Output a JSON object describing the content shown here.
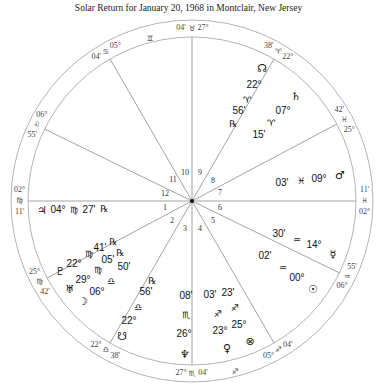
{
  "title": "Solar Return for January 20, 1968 in Montclair, New Jersey",
  "chart": {
    "center": [
      192,
      201
    ],
    "outer_radius": 181,
    "inner_radius": 164,
    "cusps": [
      {
        "house": 1,
        "angle": 180,
        "deg": "02°",
        "sign": "♍",
        "min": "11'",
        "lx": 14,
        "ly": 201
      },
      {
        "house": 2,
        "angle": 208,
        "deg": "25°",
        "sign": "♍",
        "min": "42'",
        "lx": 44,
        "ly": 272
      },
      {
        "house": 3,
        "angle": 240,
        "deg": "22°",
        "sign": "♎",
        "min": "38'",
        "lx": 100,
        "ly": 338
      },
      {
        "house": 4,
        "angle": 270,
        "deg": "27°",
        "sign": "♏",
        "min": "04'",
        "lx": 192,
        "ly": 374
      },
      {
        "house": 5,
        "angle": 300,
        "deg": "05°",
        "sign": "♐",
        "min": "04'",
        "lx": 276,
        "ly": 344
      },
      {
        "house": 6,
        "angle": 334,
        "deg": "06°",
        "sign": "♒",
        "min": "55'",
        "lx": 336,
        "ly": 293
      },
      {
        "house": 7,
        "angle": 0,
        "deg": "02°",
        "sign": "♓",
        "min": "11'",
        "lx": 364,
        "ly": 201
      },
      {
        "house": 8,
        "angle": 28,
        "deg": "25°",
        "sign": "♓",
        "min": "42'",
        "lx": 336,
        "ly": 122
      },
      {
        "house": 9,
        "angle": 60,
        "deg": "22°",
        "sign": "♈",
        "min": "38'",
        "lx": 286,
        "ly": 56
      },
      {
        "house": 10,
        "angle": 90,
        "deg": "27°",
        "sign": "♉",
        "min": "04'",
        "lx": 192,
        "ly": 28
      },
      {
        "house": 11,
        "angle": 120,
        "deg": "05°",
        "sign": "♋",
        "min": "04'",
        "lx": 107,
        "ly": 54
      },
      {
        "house": 12,
        "angle": 154,
        "deg": "06°",
        "sign": "♌",
        "min": "55'",
        "lx": 44,
        "ly": 112
      }
    ],
    "intercepted": [
      {
        "sign": "♊",
        "x": 150,
        "y": 39
      },
      {
        "sign": "♐",
        "x": 235,
        "y": 372
      }
    ],
    "house_numbers": [
      {
        "n": "1",
        "x": 165,
        "y": 208
      },
      {
        "n": "2",
        "x": 172,
        "y": 221
      },
      {
        "n": "3",
        "x": 185,
        "y": 229
      },
      {
        "n": "4",
        "x": 200,
        "y": 229
      },
      {
        "n": "5",
        "x": 213,
        "y": 221
      },
      {
        "n": "6",
        "x": 220,
        "y": 208
      },
      {
        "n": "7",
        "x": 220,
        "y": 193
      },
      {
        "n": "8",
        "x": 213,
        "y": 181
      },
      {
        "n": "9",
        "x": 200,
        "y": 173
      },
      {
        "n": "10",
        "x": 185,
        "y": 173
      },
      {
        "n": "11",
        "x": 173,
        "y": 180
      },
      {
        "n": "12",
        "x": 165,
        "y": 194
      }
    ],
    "planets": [
      {
        "name": "north-node",
        "glyph": "☊",
        "sign": "♈",
        "deg": "22°",
        "min": "56'",
        "retro": "℞",
        "items": [
          [
            "glyph",
            "☊",
            262,
            69
          ],
          [
            "text",
            "22°",
            254,
            85
          ],
          [
            "sign",
            "♈",
            247,
            100
          ],
          [
            "text",
            "56'",
            239,
            111
          ],
          [
            "text",
            "℞",
            233,
            124
          ]
        ]
      },
      {
        "name": "saturn",
        "glyph": "♄",
        "sign": "♈",
        "deg": "07°",
        "min": "15'",
        "retro": "",
        "items": [
          [
            "glyph",
            "♄",
            296,
            97
          ],
          [
            "text",
            "07°",
            283,
            111
          ],
          [
            "sign",
            "♈",
            271,
            123
          ],
          [
            "text",
            "15'",
            259,
            135
          ]
        ]
      },
      {
        "name": "mars",
        "glyph": "♂",
        "sign": "♓",
        "deg": "09°",
        "min": "03'",
        "retro": "",
        "items": [
          [
            "glyph",
            "♂",
            340,
            176
          ],
          [
            "text",
            "09°",
            319,
            179
          ],
          [
            "sign",
            "♓",
            301,
            181
          ],
          [
            "text",
            "03'",
            282,
            183
          ]
        ]
      },
      {
        "name": "mercury",
        "glyph": "☿",
        "sign": "♒",
        "deg": "14°",
        "min": "30'",
        "retro": "",
        "items": [
          [
            "glyph",
            "☿",
            333,
            255
          ],
          [
            "text",
            "14°",
            314,
            245
          ],
          [
            "sign",
            "♒",
            297,
            240
          ],
          [
            "text",
            "30'",
            279,
            234
          ]
        ]
      },
      {
        "name": "sun",
        "glyph": "☉",
        "sign": "♒",
        "deg": "00°",
        "min": "02'",
        "retro": "",
        "items": [
          [
            "glyph",
            "☉",
            313,
            290
          ],
          [
            "text",
            "00°",
            297,
            278
          ],
          [
            "sign",
            "♒",
            283,
            268
          ],
          [
            "text",
            "02'",
            265,
            256
          ]
        ]
      },
      {
        "name": "part-of-fortune",
        "glyph": "⊗",
        "sign": "♐",
        "deg": "25°",
        "min": "23'",
        "retro": "",
        "items": [
          [
            "glyph",
            "⊗",
            250,
            342
          ],
          [
            "text",
            "25°",
            239,
            325
          ],
          [
            "sign",
            "♐",
            235,
            308
          ],
          [
            "text",
            "23'",
            228,
            293
          ]
        ]
      },
      {
        "name": "venus",
        "glyph": "♀",
        "sign": "♐",
        "deg": "23°",
        "min": "03'",
        "retro": "",
        "items": [
          [
            "glyph",
            "♀",
            227,
            349
          ],
          [
            "text",
            "23°",
            220,
            331
          ],
          [
            "sign",
            "♐",
            218,
            314
          ],
          [
            "text",
            "03'",
            210,
            295
          ]
        ]
      },
      {
        "name": "neptune",
        "glyph": "♆",
        "sign": "♏",
        "deg": "26°",
        "min": "08'",
        "retro": "",
        "items": [
          [
            "glyph",
            "♆",
            185,
            355
          ],
          [
            "text",
            "26°",
            184,
            334
          ],
          [
            "sign",
            "♏",
            186,
            315
          ],
          [
            "text",
            "08'",
            186,
            296
          ]
        ]
      },
      {
        "name": "south-node",
        "glyph": "☋",
        "sign": "♎",
        "deg": "22°",
        "min": "56'",
        "retro": "℞",
        "items": [
          [
            "glyph",
            "☋",
            122,
            337
          ],
          [
            "text",
            "22°",
            129,
            321
          ],
          [
            "sign",
            "♎",
            138,
            307
          ],
          [
            "text",
            "56'",
            146,
            292
          ],
          [
            "text",
            "℞",
            152,
            281
          ]
        ]
      },
      {
        "name": "moon",
        "glyph": "☽",
        "sign": "♎",
        "deg": "06°",
        "min": "50'",
        "retro": "",
        "items": [
          [
            "glyph",
            "☽",
            83,
            302
          ],
          [
            "text",
            "06°",
            97,
            292
          ],
          [
            "sign",
            "♎",
            111,
            281
          ],
          [
            "text",
            "50'",
            124,
            267
          ]
        ]
      },
      {
        "name": "uranus",
        "glyph": "♅",
        "sign": "♍",
        "deg": "29°",
        "min": "05'",
        "retro": "℞",
        "items": [
          [
            "glyph",
            "♅",
            70,
            290
          ],
          [
            "text",
            "29°",
            83,
            280
          ],
          [
            "sign",
            "♍",
            98,
            270
          ],
          [
            "text",
            "05'",
            108,
            260
          ],
          [
            "text",
            "℞",
            120,
            253
          ]
        ]
      },
      {
        "name": "pluto",
        "glyph": "♇",
        "sign": "♍",
        "deg": "22°",
        "min": "41'",
        "retro": "℞",
        "items": [
          [
            "glyph",
            "♇",
            60,
            272
          ],
          [
            "text",
            "22°",
            74,
            264
          ],
          [
            "sign",
            "♍",
            89,
            254
          ],
          [
            "text",
            "41'",
            100,
            248
          ],
          [
            "text",
            "℞",
            113,
            242
          ]
        ]
      },
      {
        "name": "jupiter",
        "glyph": "♃",
        "sign": "♍",
        "deg": "04°",
        "min": "27'",
        "retro": "℞",
        "items": [
          [
            "glyph",
            "♃",
            42,
            211
          ],
          [
            "text",
            "04°",
            58,
            210
          ],
          [
            "sign",
            "♍",
            74,
            210
          ],
          [
            "text",
            "27'",
            89,
            210
          ],
          [
            "text",
            "℞",
            104,
            209
          ]
        ]
      }
    ]
  }
}
